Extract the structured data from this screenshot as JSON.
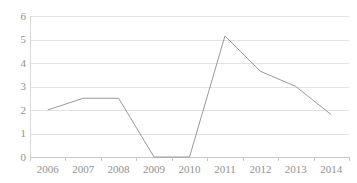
{
  "title_remnant": "———————",
  "colors": {
    "background": "#ffffff",
    "series_line": "#9a9a9a",
    "gridline": "#e2e2e2",
    "axis": "#c9c9c9",
    "tick_label": "#919191"
  },
  "chart_data": {
    "type": "line",
    "title": "",
    "xlabel": "",
    "ylabel": "",
    "categories": [
      "2006",
      "2007",
      "2008",
      "2009",
      "2010",
      "2011",
      "2012",
      "2013",
      "2014"
    ],
    "values": [
      2.0,
      2.5,
      2.5,
      0.0,
      0.0,
      5.15,
      3.65,
      3.0,
      1.8
    ],
    "series": [
      {
        "name": "",
        "values": [
          2.0,
          2.5,
          2.5,
          0.0,
          0.0,
          5.15,
          3.65,
          3.0,
          1.8
        ]
      }
    ],
    "ylim": [
      0,
      6
    ],
    "y_ticks": [
      0,
      1,
      2,
      3,
      4,
      5,
      6
    ],
    "y_tick_labels": [
      "0",
      "1",
      "2",
      "3",
      "4",
      "5",
      "6"
    ],
    "x_tick_labels": [
      "2006",
      "2007",
      "2008",
      "2009",
      "2010",
      "2011",
      "2012",
      "2013",
      "2014"
    ],
    "grid": true,
    "grid_axis": "y",
    "legend": false,
    "legend_position": "none",
    "markers": false,
    "line_width": 1
  }
}
